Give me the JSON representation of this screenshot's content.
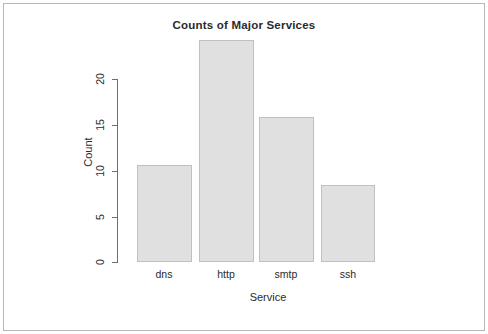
{
  "chart_data": {
    "type": "bar",
    "title": "Counts of Major Services",
    "xlabel": "Service",
    "ylabel": "Count",
    "categories": [
      "dns",
      "http",
      "smtp",
      "ssh"
    ],
    "values": [
      10,
      23,
      15,
      8
    ],
    "ylim": [
      0,
      23
    ],
    "y_ticks": [
      0,
      5,
      10,
      15,
      20
    ],
    "y_tick_labels": [
      "0",
      "5",
      "10",
      "15",
      "20"
    ],
    "grid": false,
    "legend": null,
    "bar_fill_color": "#e0e0e0",
    "bar_border_color": "#c0c0c0",
    "axis_color": "#6e6e6e",
    "text_color": "#2b2b2b",
    "background_color": "#ffffff",
    "frame_border_color": "#b8b8b8"
  }
}
